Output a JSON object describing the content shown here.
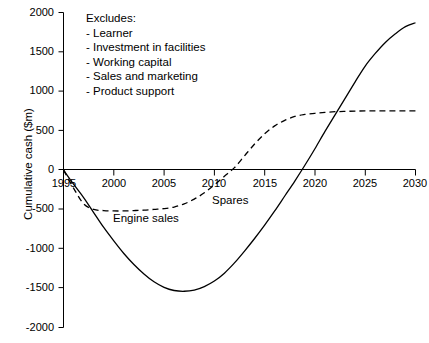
{
  "chart_data": {
    "type": "line",
    "title": "",
    "xlabel": "",
    "ylabel": "Cumulative cash ($m)",
    "xlim": [
      1995,
      2030
    ],
    "ylim": [
      -2000,
      2000
    ],
    "xticks": [
      1995,
      2000,
      2005,
      2010,
      2015,
      2020,
      2025,
      2030
    ],
    "xtick_labels": [
      "1995",
      "2000",
      "2005",
      "2010",
      "2015",
      "2020",
      "2025",
      "2030"
    ],
    "yticks": [
      -2000,
      -1500,
      -1000,
      -500,
      0,
      500,
      1000,
      1500,
      2000
    ],
    "ytick_labels": [
      "-2000",
      "-1500",
      "-1000",
      "-500",
      "0",
      "500",
      "1000",
      "1500",
      "2000"
    ],
    "grid": false,
    "legend_position": "inline-annotations",
    "series": [
      {
        "name": "Engine sales",
        "style": "dashed",
        "color": "#000000",
        "x": [
          1995,
          1996,
          1997,
          1998,
          1999,
          2000,
          2001,
          2002,
          2003,
          2004,
          2005,
          2006,
          2007,
          2008,
          2009,
          2010,
          2011,
          2012,
          2013,
          2014,
          2015,
          2016,
          2017,
          2018,
          2019,
          2020,
          2021,
          2022,
          2023,
          2024,
          2025,
          2026,
          2027,
          2028,
          2029,
          2030
        ],
        "y": [
          0,
          -230,
          -430,
          -500,
          -515,
          -520,
          -520,
          -515,
          -510,
          -500,
          -490,
          -470,
          -430,
          -370,
          -290,
          -190,
          -80,
          30,
          180,
          330,
          460,
          560,
          630,
          680,
          705,
          720,
          732,
          740,
          744,
          748,
          750,
          750,
          750,
          750,
          750,
          750
        ]
      },
      {
        "name": "Spares",
        "style": "dashed",
        "color": "#000000",
        "note": "Label for the upper portion of the dashed cumulative cash curve"
      },
      {
        "name": "Total",
        "style": "solid",
        "color": "#000000",
        "x": [
          1995,
          1996,
          1997,
          1998,
          1999,
          2000,
          2001,
          2002,
          2003,
          2004,
          2005,
          2006,
          2007,
          2008,
          2009,
          2010,
          2011,
          2012,
          2013,
          2014,
          2015,
          2016,
          2017,
          2018,
          2019,
          2020,
          2021,
          2022,
          2023,
          2024,
          2025,
          2026,
          2027,
          2028,
          2029,
          2030
        ],
        "y": [
          0,
          -180,
          -350,
          -540,
          -730,
          -900,
          -1060,
          -1200,
          -1320,
          -1420,
          -1490,
          -1530,
          -1540,
          -1525,
          -1480,
          -1410,
          -1310,
          -1180,
          -1030,
          -870,
          -700,
          -520,
          -330,
          -140,
          60,
          270,
          490,
          700,
          910,
          1120,
          1320,
          1480,
          1620,
          1730,
          1820,
          1870
        ]
      }
    ],
    "annotations": {
      "excludes_heading": "Excludes:",
      "excludes_items": [
        "- Learner",
        "- Investment in facilities",
        "- Working capital",
        "- Sales and marketing",
        "- Product support"
      ],
      "engine_sales_label": "Engine sales",
      "spares_label": "Spares"
    },
    "key_points": {
      "solid_minimum_year": 2007,
      "solid_minimum_value": -1540,
      "solid_breakeven_year": 2021,
      "solid_value_2030": 1870,
      "dashed_minimum_value": -520,
      "dashed_breakeven_year": 2012,
      "dashed_plateau_value": 750,
      "curves_crossing_year": 2024
    }
  },
  "colors": {
    "axis": "#000000",
    "curve": "#000000",
    "background": "#ffffff"
  }
}
